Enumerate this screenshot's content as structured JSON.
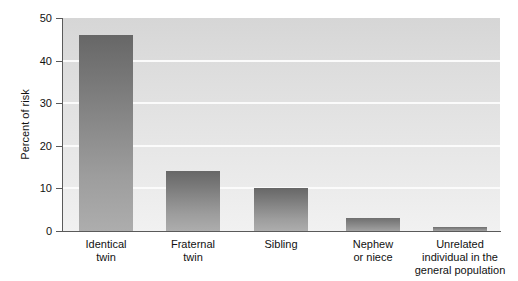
{
  "chart_data": {
    "type": "bar",
    "title": "",
    "subtitle": "",
    "xlabel": "",
    "ylabel": "Percent of risk",
    "ylim": [
      0,
      50
    ],
    "ytick_values": [
      0,
      10,
      20,
      30,
      40,
      50
    ],
    "ytick_labels": [
      "0",
      "10",
      "20",
      "30",
      "40",
      "50"
    ],
    "grid": "horizontal gridlines at 10, 20, 30, 40 (white)",
    "legend": "none",
    "categories": [
      "Identical\ntwin",
      "Fraternal\ntwin",
      "Sibling",
      "Nephew\nor niece",
      "Unrelated\nindividual in the\ngeneral population"
    ],
    "values": [
      46,
      14,
      10,
      3,
      1
    ],
    "series": [
      {
        "name": "Percent of risk",
        "values": [
          46,
          14,
          10,
          3,
          1
        ]
      }
    ],
    "bar_color_top": "#676767",
    "bar_color_bottom": "#adadad",
    "plot_background_top": "#d6d6d6",
    "plot_background_bottom": "#f1f1f1",
    "axis_color": "#5a5a5a",
    "gridline_color": "#fbfbfb",
    "text_color": "#111111"
  }
}
